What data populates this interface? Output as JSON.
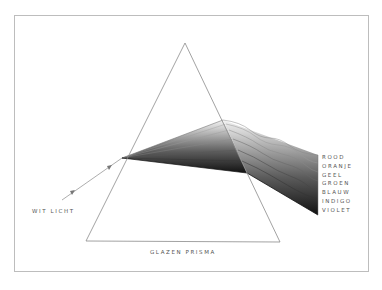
{
  "diagram": {
    "incident_label": "WIT LICHT",
    "prism_label": "GLAZEN PRISMA",
    "spectrum": [
      {
        "name": "ROOD",
        "shade": "#e6e6e6"
      },
      {
        "name": "ORANJE",
        "shade": "#c8c8c8"
      },
      {
        "name": "GEEL",
        "shade": "#a8a8a8"
      },
      {
        "name": "GROEN",
        "shade": "#888888"
      },
      {
        "name": "BLAUW",
        "shade": "#676767"
      },
      {
        "name": "INDIGO",
        "shade": "#454545"
      },
      {
        "name": "VIOLET",
        "shade": "#222222"
      }
    ]
  },
  "colors": {
    "line": "#8a8a8a",
    "frame": "#bdbdbd",
    "text": "#555555",
    "background": "#ffffff"
  }
}
